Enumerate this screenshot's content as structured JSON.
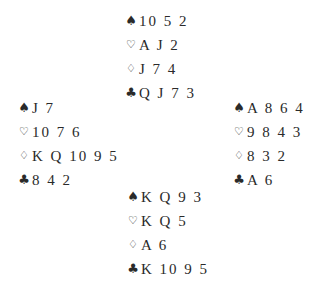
{
  "diagram": {
    "type": "bridge-deal",
    "suits": {
      "spades": "♠",
      "hearts": "♡",
      "diamonds": "♢",
      "clubs": "♣"
    },
    "hands": {
      "north": {
        "spades": "10 5 2",
        "hearts": "A J 2",
        "diamonds": "J 7 4",
        "clubs": "Q J 7 3"
      },
      "west": {
        "spades": "J 7",
        "hearts": "10 7 6",
        "diamonds": "K Q 10 9 5",
        "clubs": "8 4 2"
      },
      "east": {
        "spades": "A 8 6 4",
        "hearts": "9 8 4 3",
        "diamonds": "8 3 2",
        "clubs": "A 6"
      },
      "south": {
        "spades": "K Q 9 3",
        "hearts": "K Q 5",
        "diamonds": "A 6",
        "clubs": "K 10 9 5"
      }
    }
  }
}
